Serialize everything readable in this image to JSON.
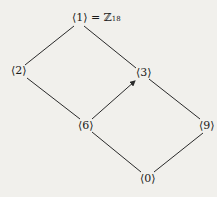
{
  "diagram": {
    "nodes": [
      {
        "id": "n1",
        "label": "⟨1⟩",
        "suffix": " = ℤ",
        "subscript": "18",
        "x": 72,
        "y": 12
      },
      {
        "id": "n2",
        "label": "⟨2⟩",
        "x": 11,
        "y": 65
      },
      {
        "id": "n3",
        "label": "⟨3⟩",
        "x": 136,
        "y": 67
      },
      {
        "id": "n6",
        "label": "⟨6⟩",
        "x": 78,
        "y": 120
      },
      {
        "id": "n9",
        "label": "⟨9⟩",
        "x": 199,
        "y": 120
      },
      {
        "id": "n0",
        "label": "⟨0⟩",
        "x": 140,
        "y": 173
      }
    ],
    "edges": [
      {
        "from": "n1",
        "to": "n2"
      },
      {
        "from": "n1",
        "to": "n3"
      },
      {
        "from": "n2",
        "to": "n6"
      },
      {
        "from": "n6",
        "to": "n3",
        "arrow": true
      },
      {
        "from": "n3",
        "to": "n9"
      },
      {
        "from": "n6",
        "to": "n0"
      },
      {
        "from": "n9",
        "to": "n0"
      }
    ],
    "line_color": "#2a2a2a"
  }
}
